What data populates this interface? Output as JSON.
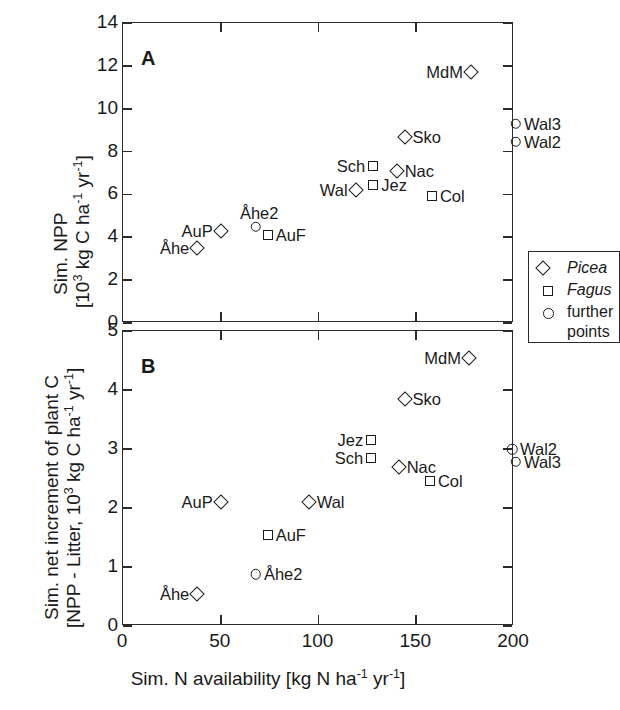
{
  "figure": {
    "xaxis": {
      "title_main": "Sim. N availability [kg N ha",
      "title_sup1": "-1",
      "title_mid": " yr",
      "title_sup2": "-1",
      "title_end": "]",
      "ticks": [
        "0",
        "50",
        "100",
        "150",
        "200"
      ],
      "min": 0,
      "max": 200
    },
    "panelA": {
      "label": "A",
      "ylabel_line1": "Sim. NPP",
      "ylabel_line2_a": "[10",
      "ylabel_line2_sup": "3",
      "ylabel_line2_b": " kg C ha",
      "ylabel_line2_sup2": "-1",
      "ylabel_line2_c": " yr",
      "ylabel_line2_sup3": "-1",
      "ylabel_line2_d": "]",
      "yticks": [
        "0",
        "2",
        "4",
        "6",
        "8",
        "10",
        "12",
        "14"
      ],
      "ymin": 0,
      "ymax": 14
    },
    "panelB": {
      "label": "B",
      "ylabel_line1": "Sim. net increment of plant C",
      "ylabel_line2_a": "[NPP - Litter, 10",
      "ylabel_line2_sup": "3",
      "ylabel_line2_b": " kg C ha",
      "ylabel_line2_sup2": "-1",
      "ylabel_line2_c": " yr",
      "ylabel_line2_sup3": "-1",
      "ylabel_line2_d": "]",
      "yticks": [
        "0",
        "1",
        "2",
        "3",
        "4",
        "5"
      ],
      "ymin": 0,
      "ymax": 5
    },
    "legend": {
      "items": [
        {
          "marker": "diamond",
          "label": "Picea",
          "italic": true
        },
        {
          "marker": "square",
          "label": "Fagus",
          "italic": true
        },
        {
          "marker": "circle",
          "label": "further",
          "label2": "points",
          "italic": false
        }
      ]
    }
  },
  "chart_data": [
    {
      "type": "scatter",
      "panel": "A",
      "title": "A",
      "xlabel": "Sim. N availability [kg N ha-1 yr-1]",
      "ylabel": "Sim. NPP [103 kg C ha-1 yr-1]",
      "xlim": [
        0,
        200
      ],
      "ylim": [
        0,
        14
      ],
      "grid": false,
      "legend_position": "inside-bottom-right",
      "series": [
        {
          "name": "Picea",
          "marker": "diamond",
          "points": [
            {
              "label": "Åhe",
              "x": 38,
              "y": 3.5,
              "label_side": "left"
            },
            {
              "label": "AuP",
              "x": 50,
              "y": 4.3,
              "label_side": "left"
            },
            {
              "label": "Wal",
              "x": 119,
              "y": 6.2,
              "label_side": "left"
            },
            {
              "label": "Nac",
              "x": 140,
              "y": 7.1,
              "label_side": "right"
            },
            {
              "label": "Sko",
              "x": 144,
              "y": 8.7,
              "label_side": "right"
            },
            {
              "label": "MdM",
              "x": 178,
              "y": 11.7,
              "label_side": "left"
            }
          ]
        },
        {
          "name": "Fagus",
          "marker": "square",
          "points": [
            {
              "label": "AuF",
              "x": 74,
              "y": 4.1,
              "label_side": "right"
            },
            {
              "label": "Jez",
              "x": 128,
              "y": 6.45,
              "label_side": "right"
            },
            {
              "label": "Sch",
              "x": 128,
              "y": 7.35,
              "label_side": "left"
            },
            {
              "label": "Col",
              "x": 158,
              "y": 5.95,
              "label_side": "right"
            }
          ]
        },
        {
          "name": "further points",
          "marker": "circle",
          "points": [
            {
              "label": "Åhe2",
              "x": 68,
              "y": 4.5,
              "label_side": "above"
            },
            {
              "label": "Wal2",
              "x": 201,
              "y": 8.45,
              "label_side": "right"
            },
            {
              "label": "Wal3",
              "x": 201,
              "y": 9.3,
              "label_side": "right"
            }
          ]
        }
      ]
    },
    {
      "type": "scatter",
      "panel": "B",
      "title": "B",
      "xlabel": "Sim. N availability [kg N ha-1 yr-1]",
      "ylabel": "Sim. net increment of plant C [NPP - Litter, 103 kg C ha-1 yr-1]",
      "xlim": [
        0,
        200
      ],
      "ylim": [
        0,
        5
      ],
      "grid": false,
      "series": [
        {
          "name": "Picea",
          "marker": "diamond",
          "points": [
            {
              "label": "Åhe",
              "x": 38,
              "y": 0.55,
              "label_side": "left"
            },
            {
              "label": "AuP",
              "x": 50,
              "y": 2.1,
              "label_side": "left"
            },
            {
              "label": "Wal",
              "x": 95,
              "y": 2.1,
              "label_side": "right"
            },
            {
              "label": "Nac",
              "x": 141,
              "y": 2.7,
              "label_side": "right"
            },
            {
              "label": "Sko",
              "x": 144,
              "y": 3.85,
              "label_side": "right"
            },
            {
              "label": "MdM",
              "x": 177,
              "y": 4.55,
              "label_side": "left"
            }
          ]
        },
        {
          "name": "Fagus",
          "marker": "square",
          "points": [
            {
              "label": "AuF",
              "x": 74,
              "y": 1.55,
              "label_side": "right"
            },
            {
              "label": "Jez",
              "x": 127,
              "y": 3.15,
              "label_side": "left"
            },
            {
              "label": "Sch",
              "x": 127,
              "y": 2.85,
              "label_side": "left"
            },
            {
              "label": "Col",
              "x": 157,
              "y": 2.45,
              "label_side": "right"
            }
          ]
        },
        {
          "name": "further points",
          "marker": "circle",
          "points": [
            {
              "label": "Åhe2",
              "x": 68,
              "y": 0.88,
              "label_side": "right"
            },
            {
              "label": "Wal2",
              "x": 199,
              "y": 3.0,
              "label_side": "right"
            },
            {
              "label": "Wal3",
              "x": 201,
              "y": 2.78,
              "label_side": "right"
            }
          ]
        }
      ]
    }
  ]
}
